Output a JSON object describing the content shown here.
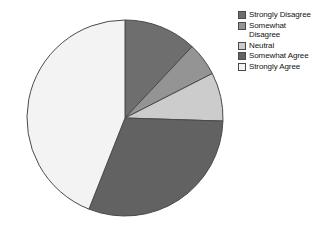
{
  "chart_data": {
    "type": "pie",
    "title": "",
    "subtitle": "",
    "xlabel": "",
    "ylabel": "",
    "grid": false,
    "legend_position": "right",
    "start_angle_deg": 0,
    "direction": "clockwise",
    "center": {
      "x": 103,
      "y": 107
    },
    "radius": 98,
    "categories": [
      "Strongly Disagree",
      "Somewhat Disagree",
      "Neutral",
      "Somewhat Agree",
      "Strongly Agree"
    ],
    "values": [
      12,
      5.5,
      8,
      30.5,
      44
    ],
    "value_unit": "%",
    "slices": [
      {
        "label": "Strongly Disagree",
        "legend_label": "Strongly Disagree",
        "value": 12,
        "percent": 12,
        "start_deg": 0,
        "end_deg": 43.2,
        "color": "#6e6e6e",
        "stroke": "#4a4a4a"
      },
      {
        "label": "Somewhat Disagree",
        "legend_label": "Somewhat\nDisagree",
        "value": 5.5,
        "percent": 5.5,
        "start_deg": 43.2,
        "end_deg": 63.0,
        "color": "#949494",
        "stroke": "#4a4a4a"
      },
      {
        "label": "Neutral",
        "legend_label": "Neutral",
        "value": 8,
        "percent": 8,
        "start_deg": 63.0,
        "end_deg": 91.8,
        "color": "#cccccc",
        "stroke": "#4a4a4a"
      },
      {
        "label": "Somewhat Agree",
        "legend_label": "Somewhat Agree",
        "value": 30.5,
        "percent": 30.5,
        "start_deg": 91.8,
        "end_deg": 201.6,
        "color": "#626262",
        "stroke": "#4a4a4a"
      },
      {
        "label": "Strongly Agree",
        "legend_label": "Strongly Agree",
        "value": 44,
        "percent": 44,
        "start_deg": 201.6,
        "end_deg": 360,
        "color": "#f3f3f3",
        "stroke": "#4a4a4a"
      }
    ]
  },
  "legend": {
    "items": [
      {
        "label": "Strongly Disagree",
        "color": "#6e6e6e"
      },
      {
        "label": "Somewhat\nDisagree",
        "color": "#949494"
      },
      {
        "label": "Neutral",
        "color": "#cccccc"
      },
      {
        "label": "Somewhat Agree",
        "color": "#626262"
      },
      {
        "label": "Strongly Agree",
        "color": "#f3f3f3"
      }
    ]
  },
  "colors": {
    "background": "#ffffff",
    "outline": "#4a4a4a",
    "text": "#141414"
  }
}
